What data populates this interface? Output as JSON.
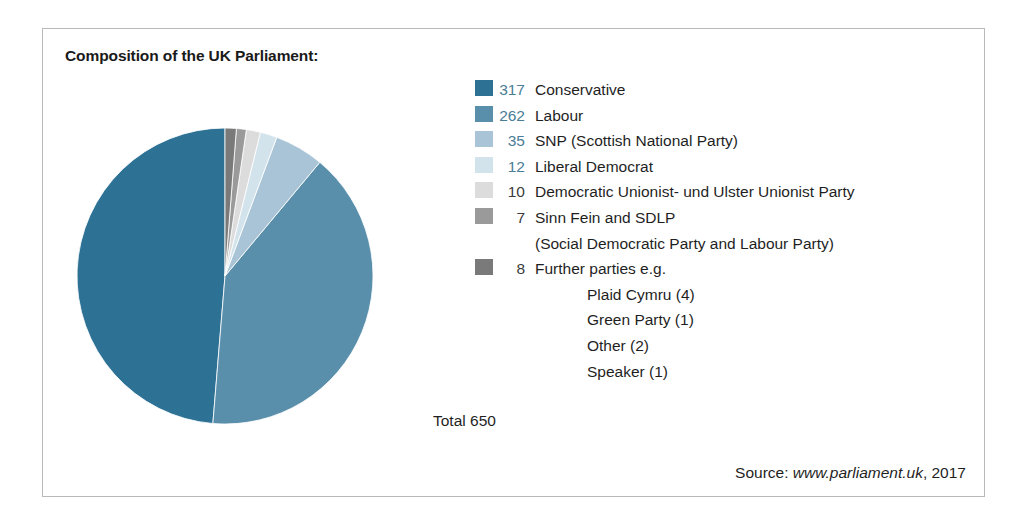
{
  "chart_title": "Composition of the UK Parliament:",
  "total_label": "Total 650",
  "source": {
    "prefix": "Source: ",
    "url": "www.parliament.uk",
    "suffix": ", 2017"
  },
  "legend": [
    {
      "value": "317",
      "label": "Conservative",
      "color": "#2d7195",
      "indent": false,
      "swatch": true,
      "muted": false
    },
    {
      "value": "262",
      "label": "Labour",
      "color": "#5a8fab",
      "indent": false,
      "swatch": true,
      "muted": false
    },
    {
      "value": "35",
      "label": "SNP (Scottish National Party)",
      "color": "#a9c4d6",
      "indent": false,
      "swatch": true,
      "muted": false
    },
    {
      "value": "12",
      "label": "Liberal Democrat",
      "color": "#d3e3ec",
      "indent": false,
      "swatch": true,
      "muted": false
    },
    {
      "value": "10",
      "label": "Democratic Unionist- und Ulster Unionist Party",
      "color": "#dcdcdc",
      "indent": false,
      "swatch": true,
      "muted": true
    },
    {
      "value": "7",
      "label": "Sinn Fein and SDLP",
      "color": "#9a9a9a",
      "indent": false,
      "swatch": true,
      "muted": true
    },
    {
      "value": "",
      "label": "(Social Democratic Party and Labour Party)",
      "color": "",
      "indent": false,
      "swatch": false,
      "muted": true
    },
    {
      "value": "8",
      "label": "Further parties e.g.",
      "color": "#7a7a7a",
      "indent": false,
      "swatch": true,
      "muted": true
    },
    {
      "value": "",
      "label": "Plaid Cymru (4)",
      "color": "",
      "indent": true,
      "swatch": false,
      "muted": true
    },
    {
      "value": "",
      "label": "Green Party (1)",
      "color": "",
      "indent": true,
      "swatch": false,
      "muted": true
    },
    {
      "value": "",
      "label": "Other (2)",
      "color": "",
      "indent": true,
      "swatch": false,
      "muted": true
    },
    {
      "value": "",
      "label": "Speaker (1)",
      "color": "",
      "indent": true,
      "swatch": false,
      "muted": true
    }
  ],
  "chart_data": {
    "type": "pie",
    "title": "Composition of the UK Parliament:",
    "total": 650,
    "categories": [
      "Conservative",
      "Labour",
      "SNP (Scottish National Party)",
      "Liberal Democrat",
      "Democratic Unionist- und Ulster Unionist Party",
      "Sinn Fein and SDLP",
      "Further parties e.g."
    ],
    "values": [
      317,
      262,
      35,
      12,
      10,
      7,
      8
    ],
    "colors": [
      "#2d7195",
      "#5a8fab",
      "#a9c4d6",
      "#d3e3ec",
      "#dcdcdc",
      "#9a9a9a",
      "#7a7a7a"
    ],
    "start_angle_deg": 0,
    "direction": "counterclockwise",
    "legend_position": "right",
    "subitems": [
      {
        "label": "Plaid Cymru",
        "value": 4
      },
      {
        "label": "Green Party",
        "value": 1
      },
      {
        "label": "Other",
        "value": 2
      },
      {
        "label": "Speaker",
        "value": 1
      }
    ],
    "source": "www.parliament.uk, 2017"
  }
}
